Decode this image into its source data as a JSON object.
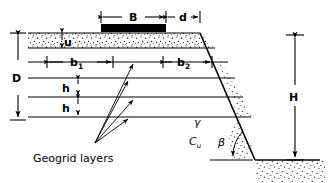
{
  "figure": {
    "background_color": "#ffffff",
    "line_color": "#000000",
    "footing_fill": "#000000",
    "stipple_color": "#000000"
  },
  "labels": {
    "footing_width": "B",
    "edge_distance": "d",
    "top_layer_depth": "u",
    "reinforced_depth": "D",
    "layer_length_left": "b",
    "layer_length_left_sub": "1",
    "layer_length_right": "b",
    "layer_length_right_sub": "2",
    "layer_spacing_1": "h",
    "layer_spacing_2": "h",
    "slope_height": "H",
    "slope_angle": "β",
    "unit_weight": "γ",
    "undrained_cohesion": "C",
    "undrained_cohesion_sub": "u",
    "geogrid_caption": "Geogrid layers"
  },
  "geometry": {
    "footing": {
      "x": 101,
      "y": 24,
      "width": 65,
      "height": 8
    },
    "crest_x": 200,
    "crest_y": 33,
    "toe_x": 255,
    "toe_y": 160,
    "ground_left_x": 28,
    "base_y": 160,
    "geogrid_layer_y": [
      62,
      78,
      97,
      117
    ],
    "top_surface_y": 33,
    "u_band_bottom_y": 48,
    "b1_span_x": [
      47,
      113
    ],
    "b2_span_x": [
      163,
      212
    ],
    "B_span_x": [
      101,
      166
    ],
    "d_span_x": [
      166,
      200
    ],
    "D_span_y": [
      33,
      120
    ],
    "H_span_y": [
      35,
      160
    ],
    "D_axis_x": 18,
    "H_axis_x": 295,
    "u_axis_x": 62,
    "h_axis_x": 78,
    "dim_top_y": 17,
    "arrow_origin": {
      "x": 95,
      "y": 143
    }
  }
}
